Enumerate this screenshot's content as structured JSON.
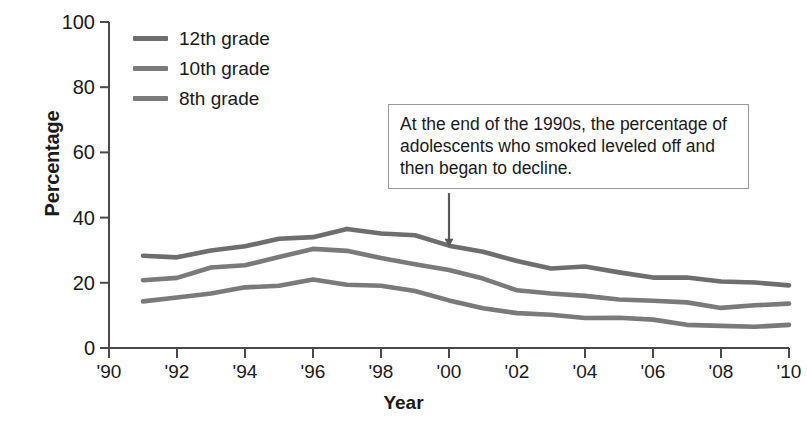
{
  "chart_data": {
    "type": "line",
    "title": "",
    "xlabel": "Year",
    "ylabel": "Percentage",
    "xlim": [
      1990,
      2010
    ],
    "ylim": [
      0,
      100
    ],
    "grid": false,
    "legend_position": "top-left",
    "y_ticks": [
      0,
      20,
      40,
      60,
      80,
      100
    ],
    "y_tick_labels": [
      "0",
      "20",
      "40",
      "60",
      "80",
      "100"
    ],
    "x_ticks": [
      1990,
      1992,
      1994,
      1996,
      1998,
      2000,
      2002,
      2004,
      2006,
      2008,
      2010
    ],
    "x_tick_labels": [
      "'90",
      "'92",
      "'94",
      "'96",
      "'98",
      "'00",
      "'02",
      "'04",
      "'06",
      "'08",
      "'10"
    ],
    "x": [
      1991,
      1992,
      1993,
      1994,
      1995,
      1996,
      1997,
      1998,
      1999,
      2000,
      2001,
      2002,
      2003,
      2004,
      2005,
      2006,
      2007,
      2008,
      2009,
      2010
    ],
    "series": [
      {
        "name": "12th grade",
        "color": "#6e6e6e",
        "values": [
          28.3,
          27.8,
          29.9,
          31.2,
          33.5,
          34.0,
          36.5,
          35.1,
          34.6,
          31.4,
          29.5,
          26.7,
          24.4,
          25.0,
          23.2,
          21.6,
          21.6,
          20.4,
          20.1,
          19.2
        ]
      },
      {
        "name": "10th grade",
        "color": "#7a7a7a",
        "values": [
          20.8,
          21.5,
          24.7,
          25.4,
          27.9,
          30.4,
          29.8,
          27.6,
          25.7,
          23.9,
          21.3,
          17.7,
          16.7,
          16.0,
          14.9,
          14.5,
          14.0,
          12.3,
          13.1,
          13.6
        ]
      },
      {
        "name": "8th grade",
        "color": "#7a7a7a",
        "values": [
          14.3,
          15.5,
          16.7,
          18.6,
          19.1,
          21.0,
          19.4,
          19.1,
          17.5,
          14.6,
          12.2,
          10.7,
          10.2,
          9.2,
          9.3,
          8.7,
          7.1,
          6.8,
          6.5,
          7.1
        ]
      }
    ],
    "annotations": [
      {
        "text": "At the end of the 1990s, the percentage of adolescents who smoked leveled off and then began to decline.",
        "points_to_year": 2000,
        "points_to_value": 31.4
      }
    ]
  }
}
